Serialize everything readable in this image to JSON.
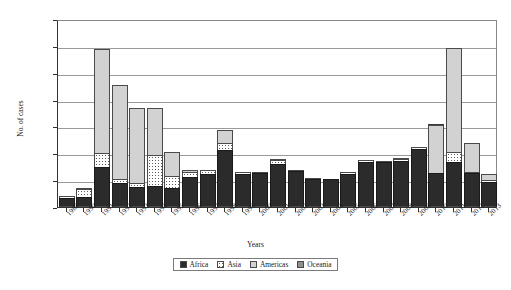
{
  "chart_data": {
    "type": "bar",
    "stacked": true,
    "title": "",
    "xlabel": "Years",
    "ylabel": "No. of cases",
    "ylim": [
      0,
      700000
    ],
    "ytick_step": 100000,
    "ytick_labels": [
      "0",
      "100 000",
      "200 000",
      "300 000",
      "400 000",
      "500 000",
      "600 000",
      "700 000"
    ],
    "ytick_values": [
      0,
      100000,
      200000,
      300000,
      400000,
      500000,
      600000,
      700000
    ],
    "grid": true,
    "legend_position": "bottom-center",
    "categories": [
      "1989",
      "1990",
      "1991",
      "1992",
      "1993",
      "1994",
      "1995",
      "1996",
      "1997",
      "1998",
      "1999",
      "2000",
      "2001",
      "2002",
      "2003",
      "2004",
      "2005",
      "2006",
      "2007",
      "2008",
      "2009",
      "2010",
      "2011",
      "2012",
      "2013"
    ],
    "series": [
      {
        "name": "Africa",
        "color": "#2b2b2b",
        "values": [
          33000,
          38000,
          148000,
          90000,
          75000,
          78000,
          72000,
          112000,
          122000,
          214000,
          123000,
          125000,
          162000,
          133000,
          104000,
          103000,
          124000,
          167000,
          166000,
          171000,
          215000,
          125000,
          168000,
          125000,
          95000
        ]
      },
      {
        "name": "Asia",
        "color": "#ffffff",
        "values": [
          12000,
          34000,
          57000,
          18000,
          20000,
          120000,
          46000,
          22000,
          18000,
          29000,
          10000,
          8000,
          18000,
          8000,
          8000,
          6000,
          10000,
          11000,
          9000,
          13000,
          12000,
          7000,
          42000,
          8000,
          10000
        ]
      },
      {
        "name": "Americas",
        "color": "#d2d2d2",
        "values": [
          5000,
          4000,
          392000,
          355000,
          281000,
          178000,
          95000,
          11000,
          4000,
          50000,
          2000,
          1000,
          2000,
          1000,
          1000,
          1000,
          1000,
          1000,
          2000,
          6000,
          2000,
          180000,
          389000,
          114000,
          27000
        ]
      },
      {
        "name": "Oceania",
        "color": "#8f8f8f",
        "values": [
          0,
          0,
          0,
          0,
          0,
          4000,
          0,
          0,
          0,
          0,
          0,
          0,
          0,
          0,
          0,
          0,
          0,
          0,
          0,
          0,
          0,
          10000,
          0,
          0,
          0
        ]
      }
    ],
    "totals": [
      50000,
      76000,
      597000,
      463000,
      376000,
      380000,
      213000,
      145000,
      144000,
      293000,
      135000,
      134000,
      182000,
      142000,
      113000,
      110000,
      135000,
      179000,
      177000,
      190000,
      229000,
      322000,
      599000,
      247000,
      132000
    ]
  },
  "legend": {
    "items": [
      {
        "label": "Africa"
      },
      {
        "label": "Asia"
      },
      {
        "label": "Americas"
      },
      {
        "label": "Oceania"
      }
    ]
  },
  "corner": {
    "mark": ""
  }
}
